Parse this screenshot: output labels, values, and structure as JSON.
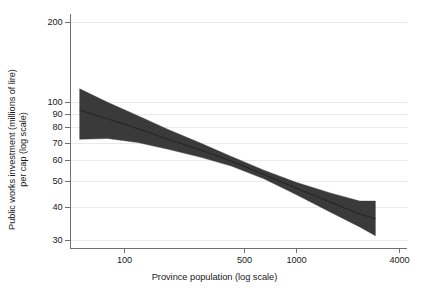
{
  "chart_data": {
    "type": "area",
    "title": "",
    "xlabel": "Province population (log scale)",
    "ylabel_line1": "Public works investment (millions of lire)",
    "ylabel_line2": "per cap (log scale)",
    "xscale": "log",
    "yscale": "log",
    "xlim": [
      48,
      4400
    ],
    "ylim": [
      28,
      215
    ],
    "x_ticks": [
      100,
      500,
      1000,
      4000
    ],
    "x_tick_labels": [
      "100",
      "500",
      "1000",
      "4000"
    ],
    "y_ticks": [
      30,
      40,
      50,
      60,
      70,
      80,
      90,
      100,
      200
    ],
    "y_tick_labels": [
      "30",
      "40",
      "50",
      "60",
      "70",
      "80",
      "90",
      "100",
      "200"
    ],
    "grid": "horizontal",
    "legend": "none",
    "band_color": "#3a3a3a",
    "fit_line_color": "#232323",
    "series": [
      {
        "name": "Fitted value",
        "x": [
          55,
          80,
          120,
          180,
          280,
          420,
          650,
          1000,
          1600,
          2350,
          2900
        ],
        "values": [
          93.0,
          86.0,
          79.0,
          72.0,
          65.5,
          59.5,
          53.0,
          47.0,
          41.5,
          37.5,
          36.0
        ]
      },
      {
        "name": "95% confidence interval upper",
        "x": [
          55,
          80,
          120,
          180,
          280,
          420,
          650,
          1000,
          1600,
          2350,
          2900
        ],
        "values": [
          112.0,
          99.5,
          88.5,
          78.5,
          69.5,
          62.0,
          55.0,
          49.5,
          45.0,
          42.0,
          42.0
        ]
      },
      {
        "name": "95% confidence interval lower",
        "x": [
          55,
          80,
          120,
          180,
          280,
          420,
          650,
          1000,
          1600,
          2350,
          2900
        ],
        "values": [
          72.0,
          72.5,
          70.0,
          66.0,
          61.5,
          57.0,
          51.0,
          44.5,
          38.0,
          33.5,
          31.0
        ]
      }
    ]
  },
  "axis": {
    "y_title_line1": "Public works investment (millions of lire)",
    "y_title_line2": "per cap (log scale)",
    "x_title": "Province population (log scale)"
  }
}
